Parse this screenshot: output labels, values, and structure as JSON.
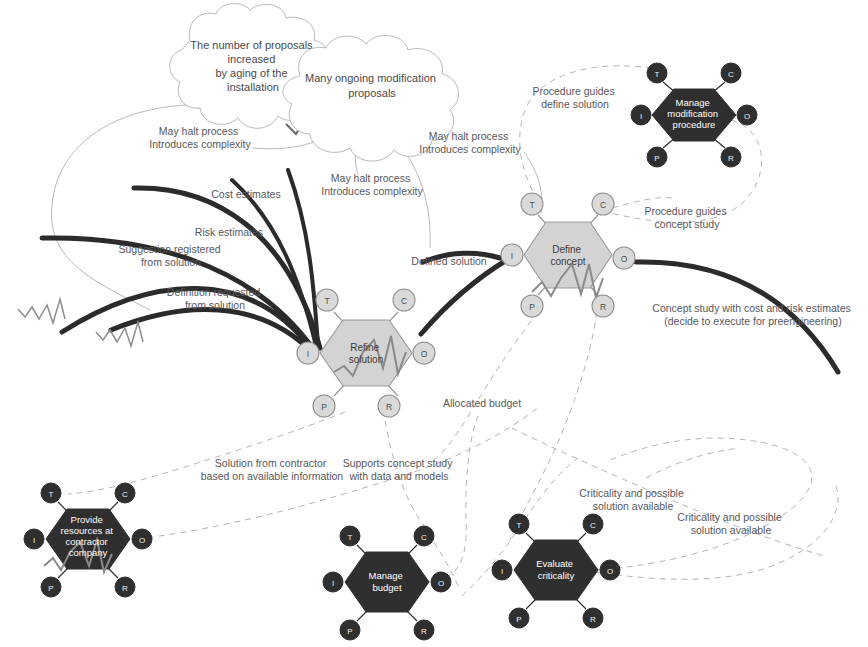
{
  "diagram": {
    "colors": {
      "dark_node": "#2f2f2f",
      "light_node": "#d3d3d3",
      "label_text": "#58585a",
      "dashed_connector": "#b4b4b4",
      "thick_arrow": "#2b2b2b",
      "background": "#ffffff"
    },
    "port_labels": {
      "t": "T",
      "c": "C",
      "i": "I",
      "o": "O",
      "p": "P",
      "r": "R"
    },
    "clouds": [
      {
        "id": "cloud-proposals-aging",
        "lines": [
          "The number of proposals",
          "increased",
          "by aging of the",
          "installation"
        ],
        "cx": 253,
        "cy": 68
      },
      {
        "id": "cloud-ongoing-modifications",
        "lines": [
          "Many ongoing modification",
          "proposals"
        ],
        "cx": 372,
        "cy": 98
      }
    ],
    "activities": [
      {
        "id": "manage-modification-procedure",
        "style": "dark",
        "lines": [
          "Manage",
          "modification",
          "procedure"
        ],
        "cx": 694,
        "cy": 115
      },
      {
        "id": "define-concept",
        "style": "light",
        "lines": [
          "Define",
          "concept"
        ],
        "cx": 568,
        "cy": 255
      },
      {
        "id": "refine-solution",
        "style": "light",
        "lines": [
          "Refine",
          "solution"
        ],
        "cx": 366,
        "cy": 353
      },
      {
        "id": "provide-resources-at-contractor-company",
        "style": "dark",
        "lines": [
          "Provide",
          "resources at",
          "contractor",
          "company"
        ],
        "cx": 88,
        "cy": 539
      },
      {
        "id": "manage-budget",
        "style": "dark",
        "lines": [
          "Manage",
          "budget"
        ],
        "cx": 387,
        "cy": 582
      },
      {
        "id": "evaluate-criticality",
        "style": "dark",
        "lines": [
          "Evaluate",
          "criticality"
        ],
        "cx": 556,
        "cy": 570
      }
    ],
    "flow_labels": [
      {
        "id": "label-may-halt-left",
        "lines": [
          "May halt process",
          "Introduces complexity"
        ],
        "x": 200,
        "y": 135,
        "align": "middle"
      },
      {
        "id": "label-may-halt-middle",
        "lines": [
          "May halt process",
          "Introduces complexity"
        ],
        "x": 372,
        "y": 182,
        "align": "middle"
      },
      {
        "id": "label-may-halt-right",
        "lines": [
          "May halt process",
          "Introduces complexity"
        ],
        "x": 470,
        "y": 140,
        "align": "middle"
      },
      {
        "id": "label-cost-estimates",
        "lines": [
          "Cost estimates"
        ],
        "x": 246,
        "y": 198,
        "align": "middle"
      },
      {
        "id": "label-risk-estimates",
        "lines": [
          "Risk estimates"
        ],
        "x": 229,
        "y": 236,
        "align": "middle"
      },
      {
        "id": "label-suggestion-registered",
        "lines": [
          "Suggestion registered",
          "from solution"
        ],
        "x": 171,
        "y": 253,
        "align": "middle"
      },
      {
        "id": "label-definition-requested",
        "lines": [
          "Definition requested",
          "from solution"
        ],
        "x": 215,
        "y": 296,
        "align": "middle"
      },
      {
        "id": "label-defined-solution",
        "lines": [
          "Defined solution"
        ],
        "x": 449,
        "y": 265,
        "align": "middle"
      },
      {
        "id": "label-procedure-guides-define-solution",
        "lines": [
          "Procedure guides",
          "define solution"
        ],
        "x": 575,
        "y": 95,
        "align": "middle"
      },
      {
        "id": "label-procedure-guides-concept-study",
        "lines": [
          "Procedure guides",
          "concept study"
        ],
        "x": 687,
        "y": 215,
        "align": "middle"
      },
      {
        "id": "label-concept-study-estimates",
        "lines": [
          "Concept study with cost and risk estimates",
          "(decide to execute for preengineering)"
        ],
        "x": 753,
        "y": 312,
        "align": "middle"
      },
      {
        "id": "label-allocated-budget",
        "lines": [
          "Allocated budget"
        ],
        "x": 482,
        "y": 407,
        "align": "middle"
      },
      {
        "id": "label-solution-from-contractor",
        "lines": [
          "Solution from contractor",
          "based on available information"
        ],
        "x": 272,
        "y": 467,
        "align": "middle"
      },
      {
        "id": "label-supports-concept-study",
        "lines": [
          "Supports concept study",
          "with data and models"
        ],
        "x": 399,
        "y": 467,
        "align": "middle"
      },
      {
        "id": "label-criticality-available-left",
        "lines": [
          "Criticality and possible",
          "solution available"
        ],
        "x": 633,
        "y": 497,
        "align": "middle"
      },
      {
        "id": "label-criticality-available-right",
        "lines": [
          "Criticality and possible",
          "solution available"
        ],
        "x": 731,
        "y": 521,
        "align": "middle"
      }
    ]
  }
}
